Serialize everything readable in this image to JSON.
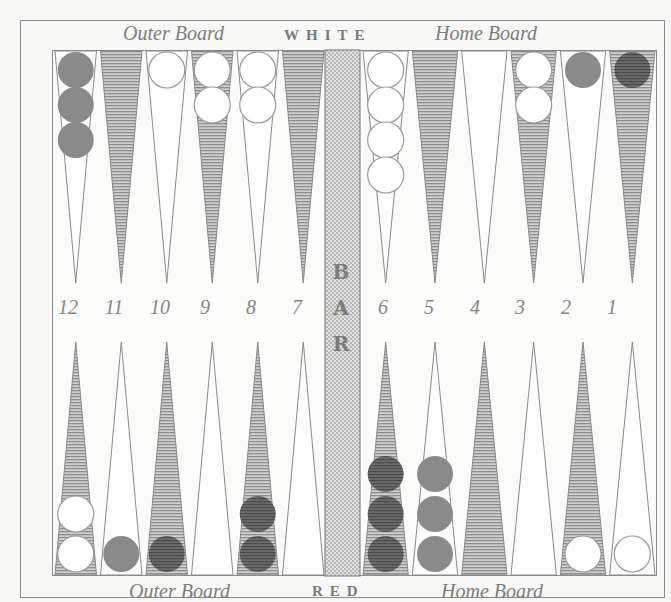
{
  "board": {
    "top_labels": {
      "left": "Outer Board",
      "center": "WHITE",
      "right": "Home Board"
    },
    "bottom_labels": {
      "left": "Outer Board",
      "center": "RED",
      "right": "Home Board"
    },
    "bar_label": [
      "B",
      "A",
      "R"
    ],
    "point_numbers": [
      "12",
      "11",
      "10",
      "9",
      "8",
      "7",
      "6",
      "5",
      "4",
      "3",
      "2",
      "1"
    ],
    "colors": {
      "shaded_point": "#b4b4b4",
      "white_checker": "#ffffff",
      "red_checker_medium": "#8a8a8a",
      "red_checker_dark": "#5e5e5e",
      "outline": "#8a8a8a"
    },
    "top_points": [
      {
        "label": "12",
        "checkers": 3,
        "color": "medium"
      },
      {
        "label": "11",
        "checkers": 0,
        "color": null
      },
      {
        "label": "10",
        "checkers": 1,
        "color": "white"
      },
      {
        "label": "9",
        "checkers": 2,
        "color": "white"
      },
      {
        "label": "8",
        "checkers": 2,
        "color": "white"
      },
      {
        "label": "7",
        "checkers": 0,
        "color": null
      },
      {
        "label": "6",
        "checkers": 4,
        "color": "white"
      },
      {
        "label": "5",
        "checkers": 0,
        "color": null
      },
      {
        "label": "4",
        "checkers": 0,
        "color": null
      },
      {
        "label": "3",
        "checkers": 2,
        "color": "white"
      },
      {
        "label": "2",
        "checkers": 1,
        "color": "medium"
      },
      {
        "label": "1",
        "checkers": 1,
        "color": "dark"
      }
    ],
    "bottom_points": [
      {
        "checkers": 2,
        "color": "white"
      },
      {
        "checkers": 1,
        "color": "medium"
      },
      {
        "checkers": 1,
        "color": "dark"
      },
      {
        "checkers": 0,
        "color": null
      },
      {
        "checkers": 2,
        "color": "dark"
      },
      {
        "checkers": 0,
        "color": null
      },
      {
        "checkers": 3,
        "color": "dark"
      },
      {
        "checkers": 3,
        "color": "medium"
      },
      {
        "checkers": 0,
        "color": null
      },
      {
        "checkers": 0,
        "color": null
      },
      {
        "checkers": 1,
        "color": "white"
      },
      {
        "checkers": 1,
        "color": "white"
      }
    ]
  }
}
